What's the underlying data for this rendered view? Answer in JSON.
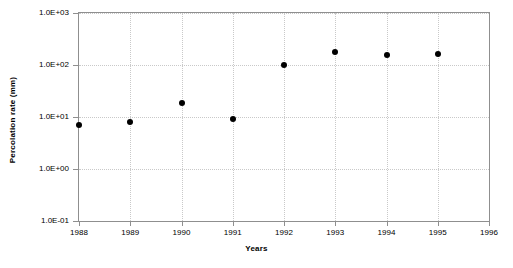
{
  "chart_data": {
    "type": "scatter",
    "title": "",
    "xlabel": "Years",
    "ylabel": "Percolation rate (mm)",
    "xlim": [
      1988,
      1996
    ],
    "ylim": [
      0.1,
      1000
    ],
    "yscale": "log",
    "grid": true,
    "legend": null,
    "xticks": [
      1988,
      1989,
      1990,
      1991,
      1992,
      1993,
      1994,
      1995,
      1996
    ],
    "xticklabels": [
      "1988",
      "1989",
      "1990",
      "1991",
      "1992",
      "1993",
      "1994",
      "1995",
      "1996"
    ],
    "yticks": [
      0.1,
      1,
      10,
      100,
      1000
    ],
    "yticklabels": [
      "1.0E-01",
      "1.0E+00",
      "1.0E+01",
      "1.0E+02",
      "1.0E+03"
    ],
    "series": [
      {
        "name": "Percolation rate",
        "marker": "circle",
        "color": "#000000",
        "x": [
          1988,
          1989,
          1990,
          1991,
          1992,
          1993,
          1994,
          1995
        ],
        "y": [
          7.0,
          8.0,
          19.0,
          9.0,
          100.0,
          175.0,
          155.0,
          165.0
        ]
      }
    ]
  }
}
